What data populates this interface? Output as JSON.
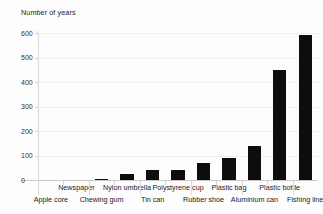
{
  "chart_data": {
    "type": "bar",
    "title": "",
    "subtitle": "",
    "ylabel": "Number of years",
    "xlabel": "",
    "ylim": [
      0,
      600
    ],
    "yticks": [
      0,
      100,
      200,
      300,
      400,
      500,
      600
    ],
    "ytick_labels": [
      "0",
      "100",
      "200",
      "300",
      "400",
      "500",
      "600"
    ],
    "grid": true,
    "legend": false,
    "bar_color": "#0d0d0d",
    "categories": [
      "Apple core",
      "Newspaper",
      "Chewing gum",
      "Nylon umbrella",
      "Tin can",
      "Polystyrene cup",
      "Rubber shoe",
      "Plastic bag",
      "Aluminium can",
      "Plastic bottle",
      "Fishing line"
    ],
    "values": [
      0,
      0,
      5,
      25,
      40,
      40,
      70,
      90,
      140,
      450,
      590
    ],
    "label_rows": [
      "bottom",
      "top",
      "bottom",
      "top",
      "bottom",
      "top",
      "bottom",
      "top",
      "bottom",
      "top",
      "bottom"
    ]
  }
}
